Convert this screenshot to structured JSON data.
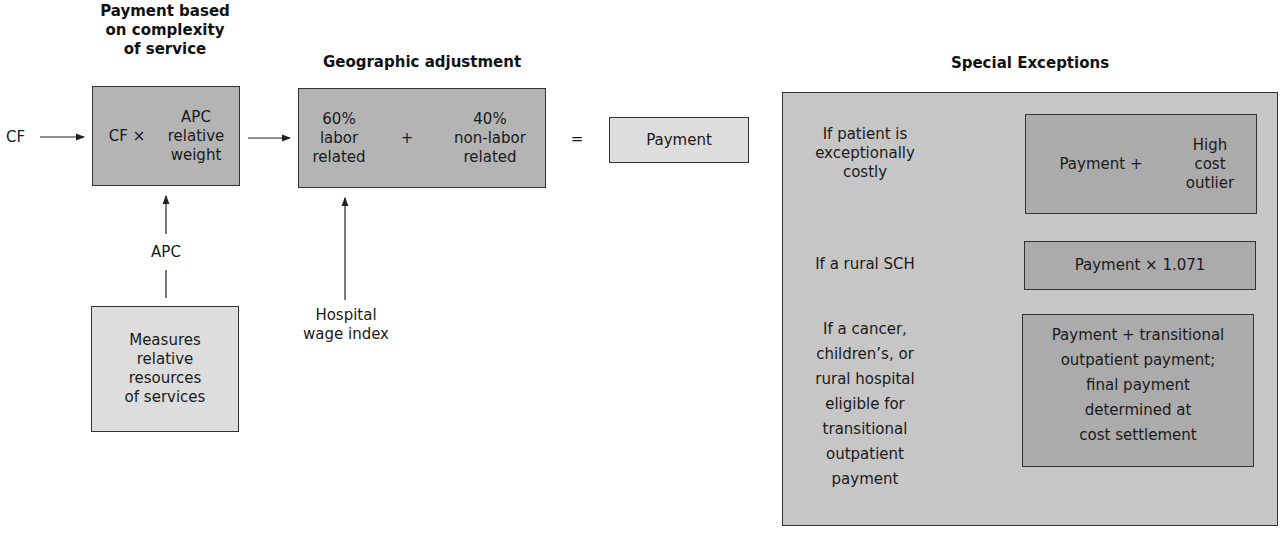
{
  "titles": {
    "complexity": "Payment based\non complexity\nof service",
    "geographic": "Geographic adjustment",
    "exceptions": "Special Exceptions"
  },
  "flow": {
    "cf_input": "CF",
    "cf_times": "CF ×",
    "apc_weight": "APC\nrelative\nweight",
    "labor": "60%\nlabor\nrelated",
    "plus": "+",
    "nonlabor": "40%\nnon-labor\nrelated",
    "equals": "=",
    "payment": "Payment",
    "apc_label": "APC",
    "measures": "Measures\nrelative\nresources\nof services",
    "wage_index": "Hospital\nwage index"
  },
  "exceptions": [
    {
      "condition": "If patient is\nexceptionally\ncostly",
      "result_left": "Payment +",
      "result_right": "High\ncost\noutlier"
    },
    {
      "condition": "If a rural SCH",
      "result": "Payment × 1.071"
    },
    {
      "condition": "If a cancer,\nchildren’s, or\nrural hospital\neligible for\ntransitional\noutpatient\npayment",
      "result": "Payment + transitional\noutpatient payment;\nfinal payment\ndetermined at\ncost settlement"
    }
  ],
  "colors": {
    "box_dark": "#b4b4b4",
    "box_light": "#dddddd",
    "exceptions_outer": "#c6c6c6",
    "exceptions_inner": "#ababab"
  }
}
